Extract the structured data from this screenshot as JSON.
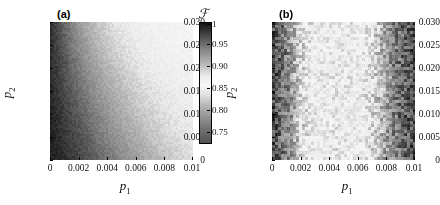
{
  "figure": {
    "background": "#ffffff",
    "colormap": "grayscale-bone-like"
  },
  "panels": [
    {
      "tag": "(a)",
      "xlabel": "p",
      "xlabel_sub": "1",
      "ylabel": "p",
      "ylabel_sub": "2",
      "xticks": [
        "0",
        "0.002",
        "0.004",
        "0.006",
        "0.008",
        "0.01"
      ],
      "yticks": [
        "0",
        "0.005",
        "0.010",
        "0.015",
        "0.020",
        "0.025",
        "0.030"
      ]
    },
    {
      "tag": "(b)",
      "xlabel": "p",
      "xlabel_sub": "1",
      "ylabel": "p",
      "ylabel_sub": "2",
      "xticks": [
        "0",
        "0.002",
        "0.004",
        "0.006",
        "0.008",
        "0.01"
      ],
      "yticks": [
        "0",
        "0.005",
        "0.010",
        "0.015",
        "0.020",
        "0.025",
        "0.030"
      ]
    }
  ],
  "colorbar": {
    "title": "ℱ",
    "ticks": [
      "1",
      "0.95",
      "0.90",
      "0.85",
      "0.80",
      "0.75"
    ],
    "vmax": "1",
    "vmin": "0.73"
  },
  "chart_data": {
    "type": "heatmap",
    "title": "",
    "xlabel": "p_1",
    "ylabel": "p_2",
    "xlim": [
      0,
      0.01
    ],
    "ylim": [
      0,
      0.03
    ],
    "zlabel": "F",
    "zlim": [
      0.73,
      1.0
    ],
    "colorbar_ticks": [
      1,
      0.95,
      0.9,
      0.85,
      0.8,
      0.75
    ],
    "grid": false,
    "legend": "none",
    "panels": [
      {
        "tag": "(a)",
        "description": "Fidelity F over (p1,p2). Smooth diagonal gradient: high F (dark, near 1) at small p1; F decreases toward ~0.85 (lightest) with increasing p1; the iso-contours tilt so that the light region reaches further left at large p2.",
        "x": [
          0.0005,
          0.0015,
          0.0025,
          0.0035,
          0.0045,
          0.0055,
          0.0065,
          0.0075,
          0.0085,
          0.0095
        ],
        "y": [
          0.0015,
          0.0045,
          0.0075,
          0.0105,
          0.0135,
          0.0165,
          0.0195,
          0.0225,
          0.0255,
          0.0285
        ],
        "z": [
          [
            0.995,
            0.985,
            0.972,
            0.958,
            0.944,
            0.93,
            0.918,
            0.906,
            0.896,
            0.888
          ],
          [
            0.994,
            0.982,
            0.968,
            0.952,
            0.937,
            0.923,
            0.911,
            0.9,
            0.891,
            0.884
          ],
          [
            0.993,
            0.979,
            0.963,
            0.946,
            0.93,
            0.916,
            0.904,
            0.894,
            0.886,
            0.88
          ],
          [
            0.992,
            0.976,
            0.958,
            0.94,
            0.923,
            0.909,
            0.898,
            0.889,
            0.882,
            0.877
          ],
          [
            0.991,
            0.972,
            0.952,
            0.933,
            0.917,
            0.903,
            0.892,
            0.884,
            0.878,
            0.874
          ],
          [
            0.99,
            0.968,
            0.946,
            0.927,
            0.91,
            0.897,
            0.887,
            0.88,
            0.875,
            0.872
          ],
          [
            0.989,
            0.964,
            0.94,
            0.92,
            0.904,
            0.891,
            0.882,
            0.876,
            0.872,
            0.87
          ],
          [
            0.988,
            0.96,
            0.934,
            0.913,
            0.897,
            0.886,
            0.878,
            0.873,
            0.87,
            0.868
          ],
          [
            0.987,
            0.955,
            0.928,
            0.907,
            0.891,
            0.881,
            0.874,
            0.87,
            0.868,
            0.867
          ],
          [
            0.986,
            0.951,
            0.922,
            0.901,
            0.886,
            0.877,
            0.871,
            0.868,
            0.866,
            0.866
          ]
        ]
      },
      {
        "tag": "(b)",
        "description": "Fidelity F over (p1,p2), noisy. Vertical banding independent of p2: dark (F near 1) for p1 < 0.002, bright band (F ~ 0.85) for 0.003 < p1 < 0.006, then dark again (F dropping toward 0.75) for p1 > 0.007.",
        "x": [
          0.0005,
          0.0015,
          0.0025,
          0.0035,
          0.0045,
          0.0055,
          0.0065,
          0.0075,
          0.0085,
          0.0095
        ],
        "y": [
          0.0015,
          0.0045,
          0.0075,
          0.0105,
          0.0135,
          0.0165,
          0.0195,
          0.0225,
          0.0255,
          0.0285
        ],
        "z": [
          [
            0.975,
            0.935,
            0.885,
            0.86,
            0.852,
            0.855,
            0.875,
            0.915,
            0.95,
            0.972
          ],
          [
            0.976,
            0.933,
            0.883,
            0.859,
            0.851,
            0.856,
            0.877,
            0.917,
            0.951,
            0.973
          ],
          [
            0.974,
            0.936,
            0.886,
            0.858,
            0.85,
            0.854,
            0.874,
            0.914,
            0.949,
            0.971
          ],
          [
            0.977,
            0.934,
            0.884,
            0.861,
            0.853,
            0.857,
            0.876,
            0.916,
            0.952,
            0.974
          ],
          [
            0.975,
            0.937,
            0.887,
            0.86,
            0.851,
            0.855,
            0.878,
            0.918,
            0.95,
            0.972
          ],
          [
            0.973,
            0.932,
            0.882,
            0.857,
            0.85,
            0.853,
            0.873,
            0.913,
            0.948,
            0.97
          ],
          [
            0.976,
            0.935,
            0.885,
            0.859,
            0.852,
            0.856,
            0.875,
            0.915,
            0.951,
            0.973
          ],
          [
            0.974,
            0.938,
            0.888,
            0.862,
            0.853,
            0.854,
            0.877,
            0.917,
            0.949,
            0.971
          ],
          [
            0.977,
            0.933,
            0.883,
            0.858,
            0.851,
            0.857,
            0.874,
            0.914,
            0.952,
            0.974
          ],
          [
            0.975,
            0.936,
            0.886,
            0.86,
            0.85,
            0.855,
            0.876,
            0.916,
            0.95,
            0.972
          ]
        ]
      }
    ]
  }
}
